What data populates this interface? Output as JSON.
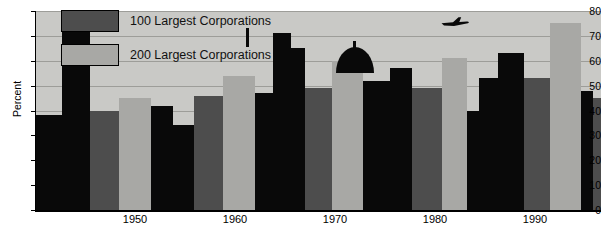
{
  "chart_data": {
    "type": "bar",
    "title": "",
    "subtitle": "",
    "xlabel": "",
    "ylabel": "Percent",
    "ylim": [
      0,
      80
    ],
    "ytick_values": [
      0,
      10,
      20,
      30,
      40,
      50,
      60,
      70,
      80
    ],
    "ytick_labels": [
      "0",
      "10",
      "20",
      "30",
      "40",
      "50",
      "60",
      "70",
      "80"
    ],
    "xtick_labels": [
      "1950",
      "1960",
      "1970",
      "1980",
      "1990"
    ],
    "grid": true,
    "legend_position": "top-left",
    "legend": [
      {
        "key": "s100",
        "label": "100 Largest Corporations",
        "color": "#4d4d4d"
      },
      {
        "key": "s200",
        "label": "200 Largest Corporations",
        "color": "#a8a8a5"
      }
    ],
    "categories": [
      "1947",
      "1954",
      "1958",
      "1963",
      "1967",
      "1972",
      "1977",
      "1982",
      "1987",
      "1992"
    ],
    "series": [
      {
        "name": "100 Largest Corporations",
        "values": [
          38,
          40,
          46,
          46,
          47,
          49,
          49,
          50,
          53,
          48
        ]
      },
      {
        "name": "200 Largest Corporations",
        "values": [
          45,
          45,
          54,
          54,
          60,
          60,
          61,
          61,
          75,
          58
        ]
      }
    ],
    "bars": [
      {
        "group": 0,
        "series": "skyline",
        "value": 38,
        "color": "#090909",
        "x": 0,
        "w": 26
      },
      {
        "group": 0,
        "series": "skyline",
        "value": 73,
        "color": "#090909",
        "x": 26,
        "w": 28
      },
      {
        "group": 0,
        "series": "s100",
        "value": 40,
        "color": "#4d4d4d",
        "x": 54,
        "w": 29
      },
      {
        "group": 0,
        "series": "s200",
        "value": 45,
        "color": "#a8a8a5",
        "x": 83,
        "w": 32
      },
      {
        "group": 1,
        "series": "skyline",
        "value": 42,
        "color": "#090909",
        "x": 115,
        "w": 22
      },
      {
        "group": 1,
        "series": "skyline",
        "value": 34,
        "color": "#090909",
        "x": 137,
        "w": 21
      },
      {
        "group": 1,
        "series": "s100",
        "value": 46,
        "color": "#4d4d4d",
        "x": 158,
        "w": 29
      },
      {
        "group": 1,
        "series": "s200",
        "value": 54,
        "color": "#a8a8a5",
        "x": 187,
        "w": 32
      },
      {
        "group": 2,
        "series": "skyline",
        "value": 47,
        "color": "#090909",
        "x": 219,
        "w": 18
      },
      {
        "group": 2,
        "series": "skyline",
        "value": 71,
        "color": "#090909",
        "x": 237,
        "w": 18
      },
      {
        "group": 2,
        "series": "skyline",
        "value": 65,
        "color": "#090909",
        "x": 255,
        "w": 14
      },
      {
        "group": 2,
        "series": "s100",
        "value": 49,
        "color": "#4d4d4d",
        "x": 269,
        "w": 27
      },
      {
        "group": 2,
        "series": "s200",
        "value": 60,
        "color": "#a8a8a5",
        "x": 296,
        "w": 31
      },
      {
        "group": 3,
        "series": "skyline",
        "value": 52,
        "color": "#090909",
        "x": 327,
        "w": 27
      },
      {
        "group": 3,
        "series": "skyline",
        "value": 57,
        "color": "#090909",
        "x": 354,
        "w": 22
      },
      {
        "group": 3,
        "series": "s100",
        "value": 49,
        "color": "#4d4d4d",
        "x": 376,
        "w": 30
      },
      {
        "group": 3,
        "series": "s200",
        "value": 61,
        "color": "#a8a8a5",
        "x": 406,
        "w": 25
      },
      {
        "group": 4,
        "series": "skyline",
        "value": 40,
        "color": "#090909",
        "x": 431,
        "w": 12
      },
      {
        "group": 4,
        "series": "skyline",
        "value": 53,
        "color": "#090909",
        "x": 443,
        "w": 19
      },
      {
        "group": 4,
        "series": "skyline",
        "value": 63,
        "color": "#090909",
        "x": 462,
        "w": 26
      },
      {
        "group": 4,
        "series": "s100",
        "value": 53,
        "color": "#4d4d4d",
        "x": 488,
        "w": 26
      },
      {
        "group": 4,
        "series": "s200",
        "value": 75,
        "color": "#a8a8a5",
        "x": 514,
        "w": 31
      },
      {
        "group": 5,
        "series": "skyline",
        "value": 48,
        "color": "#090909",
        "x": 545,
        "w": 12
      },
      {
        "group": 5,
        "series": "s100",
        "value": 45,
        "color": "#4d4d4d",
        "x": 557,
        "w": 8
      }
    ],
    "annotations": [
      {
        "name": "airplane-silhouette",
        "x": 444,
        "y": 19
      },
      {
        "name": "capitol-dome",
        "x": 342,
        "y": 47
      },
      {
        "name": "tower-spire",
        "x": 246,
        "y": 16
      }
    ]
  }
}
